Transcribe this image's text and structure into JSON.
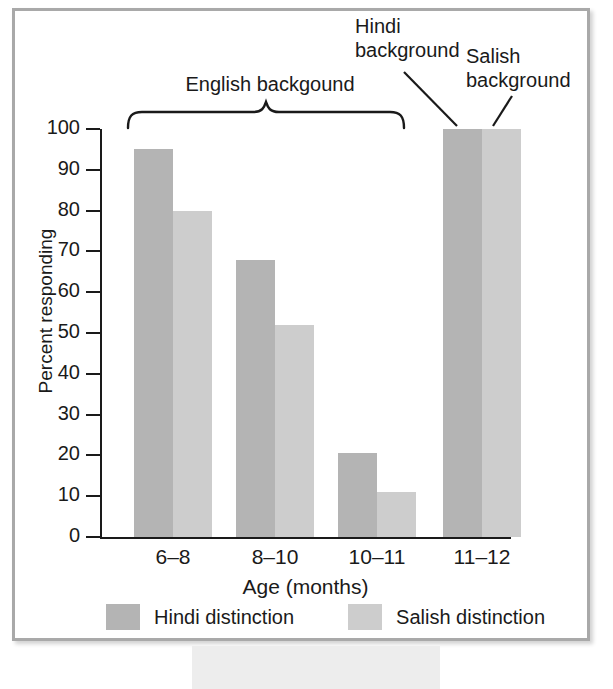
{
  "chart_data": {
    "type": "bar",
    "title": "",
    "xlabel": "Age (months)",
    "ylabel": "Percent responding",
    "categories": [
      "6–8",
      "8–10",
      "10–11",
      "11–12"
    ],
    "series": [
      {
        "name": "Hindi distinction",
        "color": "#b4b4b4",
        "values": [
          95,
          68,
          20.5,
          100
        ]
      },
      {
        "name": "Salish distinction",
        "color": "#cdcdcd",
        "values": [
          80,
          52,
          11,
          100
        ]
      }
    ],
    "ylim": [
      0,
      100
    ],
    "ytick_step": 10,
    "yticks": [
      "100",
      "90",
      "80",
      "70",
      "60",
      "50",
      "40",
      "30",
      "20",
      "10",
      "0"
    ],
    "grid": false,
    "legend_position": "bottom"
  },
  "annotations": {
    "english": "English backgound",
    "hindi": "Hindi\nbackground",
    "hindi_line1": "Hindi",
    "hindi_line2": "background",
    "salish_line1": "Salish",
    "salish_line2": "background",
    "brace": "english-group-brace"
  },
  "legend": {
    "items": [
      {
        "label": "Hindi distinction",
        "color": "#b4b4b4"
      },
      {
        "label": "Salish distinction",
        "color": "#cdcdcd"
      }
    ]
  },
  "colors": {
    "dark_bar": "#b4b4b4",
    "light_bar": "#cdcdcd",
    "axis": "#1a1a1a",
    "frame": "#a9a9a9",
    "caption_band": "#ededed"
  }
}
